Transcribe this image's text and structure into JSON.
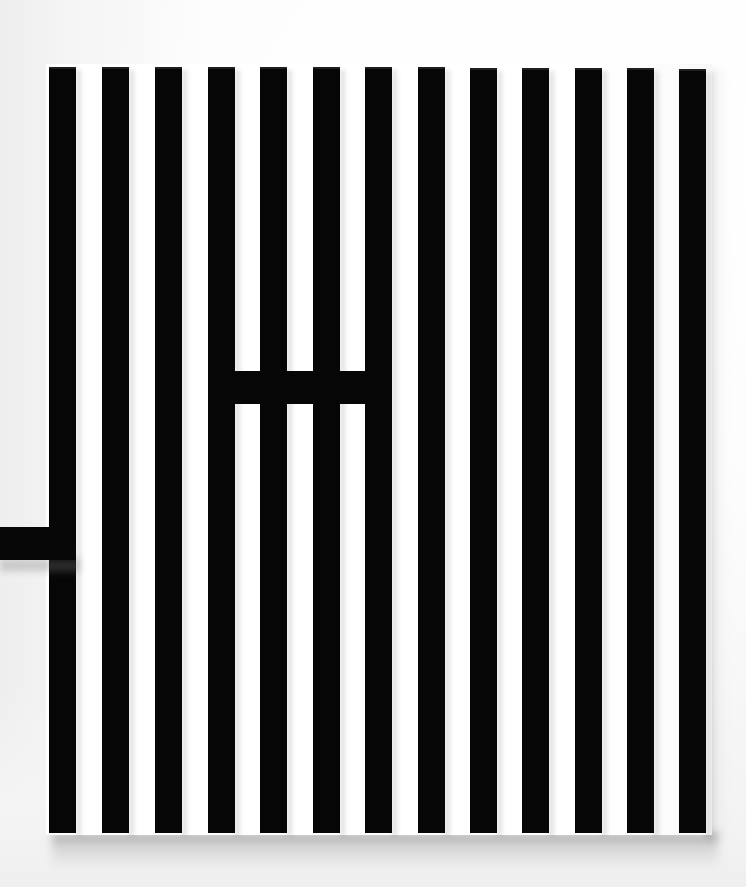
{
  "artwork": {
    "title": "Untitled (Vertical Black Bars Relief)",
    "medium": "Painted wood relief on white ground",
    "orientation": "portrait",
    "background_color": "#ffffff",
    "bar_color": "#060606",
    "wall_color": "#f2f2f2",
    "shadow_color": "#8c8c8c",
    "canvas": {
      "width": 746,
      "height": 887
    },
    "panel": {
      "name": "support-panel",
      "x": 46,
      "y": 64,
      "width": 666,
      "height": 771
    },
    "stripe_count": 13,
    "stripe_width": 27,
    "stripe_pitch": 52.3,
    "stripes": [
      {
        "index": 1,
        "label": "stripe-1",
        "x": 49,
        "y": 67,
        "width": 27,
        "height": 766
      },
      {
        "index": 2,
        "label": "stripe-2",
        "x": 102,
        "y": 67,
        "width": 27,
        "height": 766
      },
      {
        "index": 3,
        "label": "stripe-3",
        "x": 155,
        "y": 67,
        "width": 27,
        "height": 766
      },
      {
        "index": 4,
        "label": "stripe-4",
        "x": 208,
        "y": 67,
        "width": 27,
        "height": 766
      },
      {
        "index": 5,
        "label": "stripe-5",
        "x": 260,
        "y": 67,
        "width": 27,
        "height": 766
      },
      {
        "index": 6,
        "label": "stripe-6",
        "x": 313,
        "y": 67,
        "width": 27,
        "height": 766
      },
      {
        "index": 7,
        "label": "stripe-7",
        "x": 365,
        "y": 67,
        "width": 27,
        "height": 766
      },
      {
        "index": 8,
        "label": "stripe-8",
        "x": 418,
        "y": 67,
        "width": 27,
        "height": 766
      },
      {
        "index": 9,
        "label": "stripe-9",
        "x": 470,
        "y": 68,
        "width": 27,
        "height": 765
      },
      {
        "index": 10,
        "label": "stripe-10",
        "x": 522,
        "y": 68,
        "width": 27,
        "height": 765
      },
      {
        "index": 11,
        "label": "stripe-11",
        "x": 575,
        "y": 68,
        "width": 27,
        "height": 765
      },
      {
        "index": 12,
        "label": "stripe-12",
        "x": 627,
        "y": 68,
        "width": 27,
        "height": 765
      },
      {
        "index": 13,
        "label": "stripe-13",
        "x": 679,
        "y": 69,
        "width": 27,
        "height": 764
      }
    ],
    "crossbar": {
      "label": "horizontal-crossbar",
      "x": 208,
      "y": 371,
      "width": 176,
      "height": 33,
      "spans_stripes": [
        4,
        5,
        6,
        7
      ]
    },
    "left_bar": {
      "label": "left-protruding-bar",
      "x": 0,
      "y": 527,
      "width": 76,
      "height": 33,
      "note": "extends past the left edge of the panel and off-frame"
    }
  }
}
